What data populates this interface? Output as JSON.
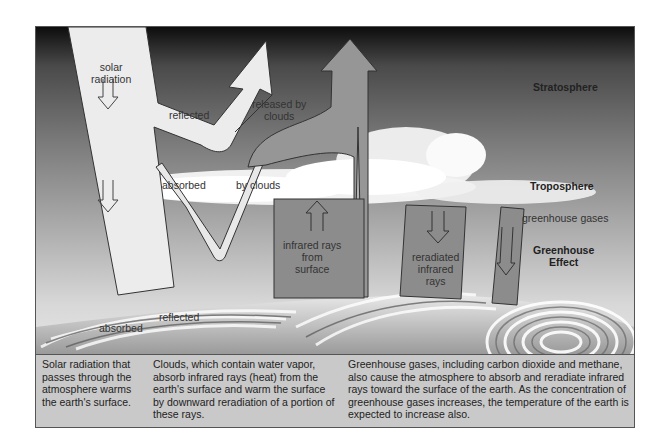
{
  "diagram": {
    "title": "Greenhouse Effect",
    "layers": {
      "stratosphere": "Stratosphere",
      "troposphere": "Troposphere",
      "greenhouse_gases": "greenhouse gases",
      "greenhouse_effect_line1": "Greenhouse",
      "greenhouse_effect_line2": "Effect"
    },
    "arrows": {
      "solar_line1": "solar",
      "solar_line2": "radiation",
      "reflected_top": "reflected",
      "released_line1": "released by",
      "released_line2": "clouds",
      "absorbed_cloud": "absorbed",
      "by_clouds": "by clouds",
      "infrared_line1": "infrared rays",
      "infrared_line2": "from",
      "infrared_line3": "surface",
      "reradiated_line1": "reradiated",
      "reradiated_line2": "infrared",
      "reradiated_line3": "rays",
      "absorbed_surface": "absorbed",
      "reflected_surface": "reflected"
    },
    "colors": {
      "sky_top": "#111111",
      "sky_mid": "#7a7a7a",
      "sky_low": "#d4d4d4",
      "solar_arrow": "#ececec",
      "infrared_arrow": "#8c8c8c",
      "caption_bg": "#c9c9c9"
    }
  },
  "captions": [
    {
      "text": "Solar radiation that passes through the atmosphere warms the earth's surface."
    },
    {
      "text": "Clouds, which contain water vapor, absorb infrared rays (heat) from the earth's surface and warm the surface by downward reradiation of a portion of these rays."
    },
    {
      "text": "Greenhouse gases, including carbon dioxide and methane, also cause the atmosphere to absorb and reradiate infrared rays toward the surface of the earth. As the concentration of greenhouse gases increases, the temperature of the earth is expected to increase also."
    }
  ]
}
